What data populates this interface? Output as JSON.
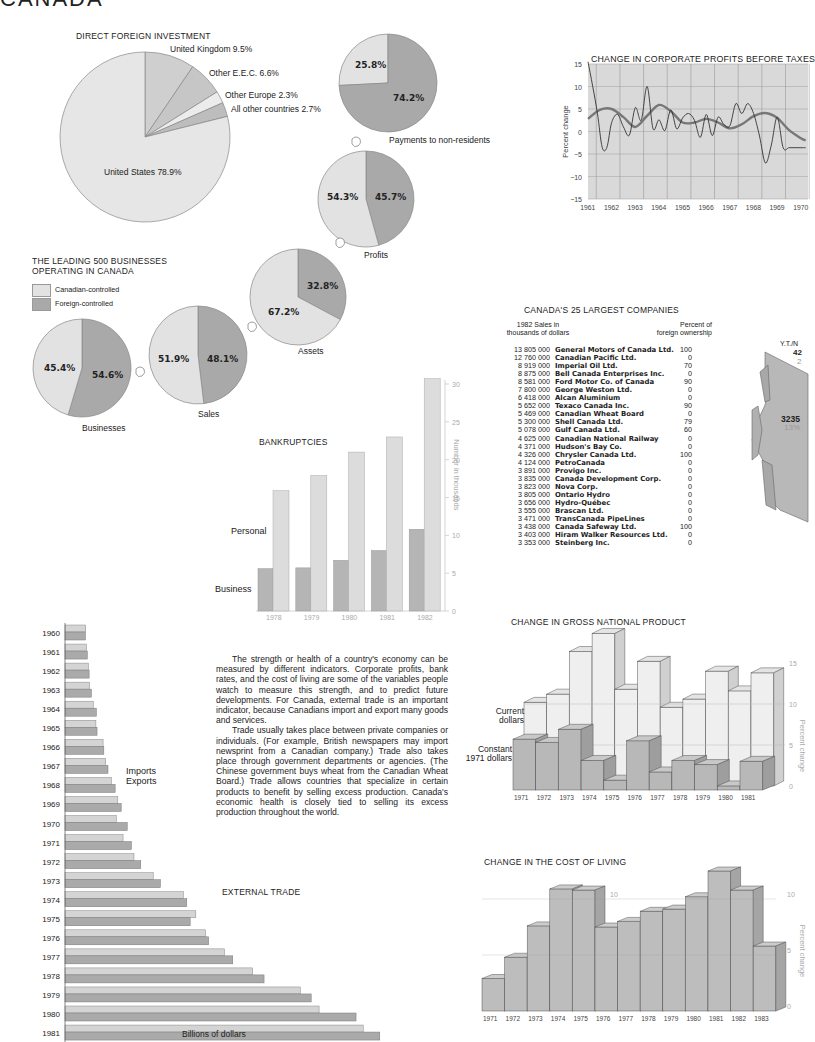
{
  "page_title": "CANADA",
  "intro_text": [
    "The strength or health of a country's economy can be measured by different indicators. Corporate profits, bank rates, and the cost of living are some of the variables people watch to measure this strength, and to predict future developments. For Canada, external trade is an important indicator, because Canadians import and export many goods and services.",
    "Trade usually takes place between private companies or individuals. (For example, British newspapers may import newsprint from a Canadian company.) Trade also takes place through government departments or agencies. (The Chinese government buys wheat from the Canadian Wheat Board.) Trade allows countries that specialize in certain products to benefit by selling excess production. Canada's economic health is closely tied to selling its excess production throughout the world."
  ],
  "leading500": {
    "title_line1": "THE LEADING 500 BUSINESSES",
    "title_line2": "OPERATING IN CANADA",
    "legend": [
      {
        "label": "Canadian-controlled",
        "color": "#e2e2e2"
      },
      {
        "label": "Foreign-controlled",
        "color": "#a9a9a9"
      }
    ],
    "arrow_label_payments": "Payments to non-residents"
  },
  "map": {
    "region_label": "Y.T./N",
    "region_value": "42",
    "region_pct": "2",
    "main_value": "3235",
    "main_pct": "13%"
  },
  "chart_data": [
    {
      "id": "direct-foreign-investment",
      "type": "pie",
      "title": "DIRECT FOREIGN INVESTMENT",
      "slices": [
        {
          "label": "United Kingdom",
          "value": 9.5,
          "text": "United Kingdom 9.5%"
        },
        {
          "label": "Other E.E.C.",
          "value": 6.6,
          "text": "Other E.E.C. 6.6%"
        },
        {
          "label": "Other Europe",
          "value": 2.3,
          "text": "Other Europe 2.3%"
        },
        {
          "label": "All other countries",
          "value": 2.7,
          "text": "All other countries 2.7%"
        },
        {
          "label": "United States",
          "value": 78.9,
          "text": "United States 78.9%"
        }
      ]
    },
    {
      "id": "leading-500-pies",
      "type": "pie",
      "title": "THE LEADING 500 BUSINESSES OPERATING IN CANADA",
      "legend": [
        "Canadian-controlled",
        "Foreign-controlled"
      ],
      "pies": [
        {
          "name": "Businesses",
          "canadian": 45.4,
          "foreign": 54.6,
          "canadian_text": "45.4%",
          "foreign_text": "54.6%"
        },
        {
          "name": "Sales",
          "canadian": 51.9,
          "foreign": 48.1,
          "canadian_text": "51.9%",
          "foreign_text": "48.1%"
        },
        {
          "name": "Assets",
          "canadian": 67.2,
          "foreign": 32.8,
          "canadian_text": "67.2%",
          "foreign_text": "32.8%"
        },
        {
          "name": "Profits",
          "canadian": 54.3,
          "foreign": 45.7,
          "canadian_text": "54.3%",
          "foreign_text": "45.7%"
        },
        {
          "name": "Payments to non-residents",
          "canadian": 25.8,
          "foreign": 74.2,
          "canadian_text": "25.8%",
          "foreign_text": "74.2%"
        }
      ]
    },
    {
      "id": "corporate-profits",
      "type": "line",
      "title": "CHANGE IN CORPORATE PROFITS BEFORE TAXES",
      "xlabel": "",
      "ylabel": "Percent change",
      "ylim": [
        -15,
        15
      ],
      "yticks": [
        "15",
        "10",
        "5",
        "0",
        "−10",
        "−15"
      ],
      "yticks_values": [
        15,
        10,
        5,
        0,
        -5,
        -10,
        -15
      ],
      "ytick_labels": [
        "15",
        "10",
        "5",
        "0",
        "−5",
        "−10",
        "−15"
      ],
      "xticks": [
        "1961",
        "1962",
        "1963",
        "1964",
        "1965",
        "1966",
        "1967",
        "1968",
        "1969",
        "1970"
      ],
      "grid": true,
      "series": [
        {
          "name": "quarterly",
          "x": [
            1961.0,
            1961.2,
            1961.4,
            1961.6,
            1961.8,
            1962.0,
            1962.25,
            1962.5,
            1962.75,
            1963.0,
            1963.25,
            1963.5,
            1963.75,
            1964.0,
            1964.25,
            1964.5,
            1964.75,
            1965.0,
            1965.25,
            1965.5,
            1965.75,
            1966.0,
            1966.25,
            1966.5,
            1966.75,
            1967.0,
            1967.25,
            1967.5,
            1967.75,
            1968.0,
            1968.25,
            1968.5,
            1968.75,
            1969.0,
            1969.25,
            1969.5,
            1969.75,
            1970.0,
            1970.2
          ],
          "values": [
            15.5,
            10,
            4,
            -3.5,
            -3.5,
            2,
            3.8,
            1,
            -0.8,
            5.3,
            2.5,
            10,
            0.6,
            2.6,
            0.2,
            4.8,
            0.6,
            3,
            4,
            2.5,
            -1.3,
            3.8,
            -0.9,
            3.2,
            1.5,
            1.3,
            6.2,
            4,
            6.2,
            4,
            -1,
            -7,
            -3,
            3.2,
            -3.6,
            -3.6,
            -3.6,
            -3.6,
            -3.6
          ]
        },
        {
          "name": "trend",
          "x": [
            1961.0,
            1961.5,
            1962.0,
            1962.5,
            1963.0,
            1963.5,
            1964.0,
            1964.5,
            1965.0,
            1965.5,
            1966.0,
            1966.5,
            1967.0,
            1967.5,
            1968.0,
            1968.5,
            1969.0,
            1969.5,
            1970.0,
            1970.2
          ],
          "values": [
            2.8,
            4.8,
            5,
            3.2,
            1,
            3.5,
            5.9,
            4.5,
            2,
            2,
            2.8,
            2,
            0.7,
            1.6,
            3.4,
            4.1,
            3,
            0.3,
            -1.5,
            -2
          ]
        }
      ]
    },
    {
      "id": "largest-companies",
      "type": "table",
      "title": "CANADA'S 25 LARGEST COMPANIES",
      "columns": [
        "1982 Sales in thousands of dollars",
        "Company",
        "Percent of foreign ownership"
      ],
      "col1_line1": "1982 Sales in",
      "col1_line2": "thousands of dollars",
      "col3_line1": "Percent of",
      "col3_line2": "foreign ownership",
      "rows": [
        [
          "13 805 000",
          "General Motors of Canada Ltd.",
          "100"
        ],
        [
          "12 760 000",
          "Canadian Pacific Ltd.",
          "0"
        ],
        [
          "8 919 000",
          "Imperial Oil Ltd.",
          "70"
        ],
        [
          "8 875 000",
          "Bell Canada Enterprises Inc.",
          "0"
        ],
        [
          "8 581 000",
          "Ford Motor Co. of Canada",
          "90"
        ],
        [
          "7 800 000",
          "George Weston Ltd.",
          "0"
        ],
        [
          "6 418 000",
          "Alcan Aluminium",
          "0"
        ],
        [
          "5 652 000",
          "Texaco Canada Inc.",
          "90"
        ],
        [
          "5 469 000",
          "Canadian Wheat Board",
          "0"
        ],
        [
          "5 300 000",
          "Shell Canada Ltd.",
          "79"
        ],
        [
          "5 078 000",
          "Gulf Canada Ltd.",
          "60"
        ],
        [
          "4 625 000",
          "Canadian National Railway",
          "0"
        ],
        [
          "4 371 000",
          "Hudson's Bay Co.",
          "0"
        ],
        [
          "4 326 000",
          "Chrysler Canada Ltd.",
          "100"
        ],
        [
          "4 124 000",
          "PetroCanada",
          "0"
        ],
        [
          "3 891 000",
          "Provigo Inc.",
          "0"
        ],
        [
          "3 835 000",
          "Canada Development Corp.",
          "0"
        ],
        [
          "3 823 000",
          "Nova Corp.",
          "0"
        ],
        [
          "3 805 000",
          "Ontario Hydro",
          "0"
        ],
        [
          "3 656 000",
          "Hydro-Québec",
          "0"
        ],
        [
          "3 555 000",
          "Brascan Ltd.",
          "0"
        ],
        [
          "3 471 000",
          "TransCanada PipeLines",
          "0"
        ],
        [
          "3 438 000",
          "Canada Safeway Ltd.",
          "100"
        ],
        [
          "3 403 000",
          "Hiram Walker Resources Ltd.",
          "0"
        ],
        [
          "3 353 000",
          "Steinberg Inc.",
          "0"
        ]
      ]
    },
    {
      "id": "bankruptcies",
      "type": "bar",
      "title": "BANKRUPTCIES",
      "categories": [
        "1978",
        "1979",
        "1980",
        "1981",
        "1982"
      ],
      "series": [
        {
          "name": "Business",
          "values": [
            5.6,
            5.7,
            6.7,
            8,
            10.8
          ]
        },
        {
          "name": "Personal",
          "values": [
            15.9,
            17.9,
            21,
            23,
            30.7
          ]
        }
      ],
      "ylabel": "Number in thousands",
      "ylim": [
        0,
        30
      ],
      "yticks": [
        "0",
        "5",
        "10",
        "15",
        "20",
        "25",
        "30"
      ]
    },
    {
      "id": "external-trade",
      "type": "bar",
      "orientation": "horizontal",
      "title": "EXTERNAL TRADE",
      "categories": [
        "1960",
        "1961",
        "1962",
        "1963",
        "1964",
        "1965",
        "1966",
        "1967",
        "1968",
        "1969",
        "1970",
        "1971",
        "1972",
        "1973",
        "1974",
        "1975",
        "1976",
        "1977",
        "1978",
        "1979",
        "1980",
        "1981"
      ],
      "series": [
        {
          "name": "Imports",
          "values": [
            5.5,
            5.7,
            6.2,
            6.5,
            7.5,
            8.2,
            10.1,
            10.8,
            12.3,
            14.0,
            13.6,
            15.4,
            18.3,
            23.4,
            31.4,
            34.7,
            37.3,
            42.3,
            49.8,
            62.4,
            67.4,
            79.1
          ]
        },
        {
          "name": "Exports",
          "values": [
            5.4,
            5.9,
            6.4,
            7.0,
            8.3,
            8.5,
            10.3,
            11.4,
            13.3,
            14.9,
            16.5,
            17.6,
            20.1,
            25.3,
            32.3,
            33.2,
            38.1,
            44.5,
            52.8,
            65.3,
            77.2,
            83.5
          ]
        }
      ],
      "xlabel": "Billions of dollars",
      "xlim": [
        0,
        85
      ],
      "xticks": [
        "0",
        "10",
        "20",
        "30",
        "40",
        "50",
        "60",
        "70",
        "80"
      ]
    },
    {
      "id": "gnp",
      "type": "bar",
      "title": "CHANGE IN GROSS NATIONAL PRODUCT",
      "categories": [
        "1971",
        "1972",
        "1973",
        "1974",
        "1975",
        "1976",
        "1977",
        "1978",
        "1979",
        "1980",
        "1981"
      ],
      "series": [
        {
          "name": "Current dollars",
          "values": [
            10.2,
            11.2,
            16.4,
            18.6,
            11.8,
            15.2,
            9.6,
            10.6,
            14,
            11.6,
            13.8
          ]
        },
        {
          "name": "Constant 1971 dollars",
          "values": [
            6.2,
            5.8,
            7.4,
            3.6,
            1.2,
            6.0,
            2.2,
            3.6,
            3.1,
            0.5,
            3.5
          ]
        }
      ],
      "legend": [
        "Current dollars",
        "Constant 1971 dollars"
      ],
      "ylabel": "Percent change",
      "ylim": [
        0,
        15
      ],
      "yticks": [
        "0",
        "5",
        "10",
        "15"
      ]
    },
    {
      "id": "cost-of-living",
      "type": "bar",
      "title": "CHANGE IN THE COST OF LIVING",
      "categories": [
        "1971",
        "1972",
        "1973",
        "1974",
        "1975",
        "1976",
        "1977",
        "1978",
        "1979",
        "1980",
        "1981",
        "1982",
        "1983"
      ],
      "values": [
        2.9,
        4.8,
        7.6,
        10.9,
        10.8,
        7.5,
        8.0,
        8.9,
        9.1,
        10.2,
        12.5,
        10.8,
        5.8
      ],
      "ylabel": "Percent change",
      "ylim": [
        0,
        12
      ],
      "yticks": [
        "0",
        "5",
        "10"
      ]
    }
  ]
}
